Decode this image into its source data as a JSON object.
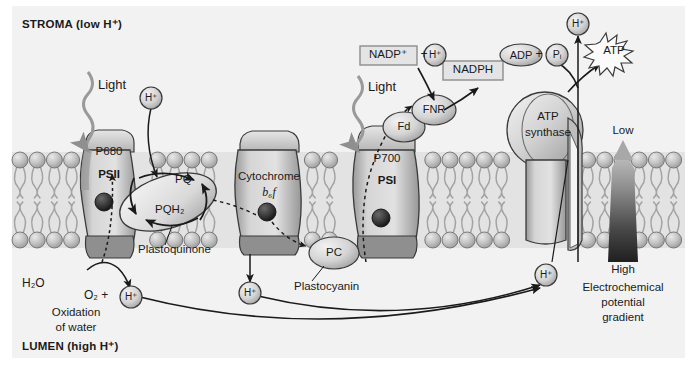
{
  "figure": {
    "type": "biology-diagram",
    "width": 697,
    "height": 370
  },
  "compartments": {
    "stroma_label": "STROMA (low H⁺)",
    "lumen_label": "LUMEN (high H⁺)"
  },
  "complexes": {
    "psii": {
      "reaction_center": "P680",
      "name": "PSII",
      "carrier": "e⁻"
    },
    "cytochrome": {
      "name": "Cytochrome",
      "subunits": "b₆f",
      "carrier": "e⁻"
    },
    "psi": {
      "reaction_center": "P700",
      "name": "PSI",
      "carrier": "e⁻"
    },
    "atp_synthase": {
      "line1": "ATP",
      "line2": "synthase"
    }
  },
  "carriers": {
    "pq": "PQ",
    "pqh2": "PQH₂",
    "plastoquinone_label": "Plastoquinone",
    "pc": "PC",
    "plastocyanin_label": "Plastocyanin",
    "fd": "Fd",
    "fnr": "FNR"
  },
  "molecules": {
    "light_left": "Light",
    "light_right": "Light",
    "water": "H₂O",
    "oxygen": "O₂ +",
    "proton": "H⁺",
    "nadp_plus": "NADP⁺",
    "plus": "+",
    "nadph": "NADPH",
    "adp": "ADP",
    "pi": "Pᵢ",
    "atp": "ATP"
  },
  "annotations": {
    "oxidation_line1": "Oxidation",
    "oxidation_line2": "of water",
    "gradient_low": "Low",
    "gradient_high": "High",
    "gradient_line1": "Electrochemical",
    "gradient_line2": "potential",
    "gradient_line3": "gradient"
  },
  "protons": {
    "psii_stroma": "H⁺",
    "nadp_partner": "H⁺",
    "lumen_from_water": "H⁺",
    "lumen_from_cytb6f": "H⁺",
    "lumen_to_atpsynthase": "H⁺",
    "stroma_from_atpsynthase": "H⁺"
  },
  "colors": {
    "background": "#f2f2f2",
    "page": "#ffffff",
    "membrane_head": "#b9b9b9",
    "membrane_tail": "#d8d8d8",
    "complex_fill": "#c8c8c8",
    "complex_dark": "#8a8a8a",
    "outline": "#3a3a3a",
    "text": "#1a1a1a",
    "gradient_dark": "#2b2b2b",
    "gradient_light": "#d0d0d0"
  }
}
